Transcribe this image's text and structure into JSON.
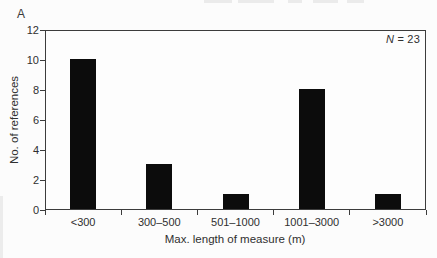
{
  "panel_label": "A",
  "annotation": {
    "symbol": "N",
    "rest": " = 23",
    "full_text": "N = 23"
  },
  "chart_data": {
    "type": "bar",
    "categories": [
      "<300",
      "300–500",
      "501–1000",
      "1001–3000",
      ">3000"
    ],
    "values": [
      10,
      3,
      1,
      8,
      1
    ],
    "title": "",
    "xlabel": "Max. length of measure (m)",
    "ylabel": "No. of references",
    "ylim": [
      0,
      12
    ],
    "yticks": [
      0,
      2,
      4,
      6,
      8,
      10,
      12
    ],
    "grid": false,
    "legend": "none",
    "bar_color": "#0c0c0c",
    "n_total": 23,
    "annotation": "N = 23",
    "panel_label": "A"
  },
  "colors": {
    "axis": "#3c3c3c",
    "text": "#2f2f2f",
    "bar": "#0c0c0c",
    "background": "#fcfcfc"
  }
}
